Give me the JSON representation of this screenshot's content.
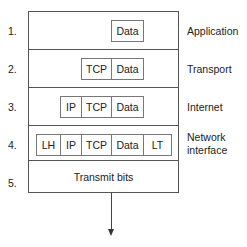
{
  "diagram": {
    "layers": [
      {
        "number": "1.",
        "name": "Application",
        "cells": [
          "Data"
        ]
      },
      {
        "number": "2.",
        "name": "Transport",
        "cells": [
          "TCP",
          "Data"
        ]
      },
      {
        "number": "3.",
        "name": "Internet",
        "cells": [
          "IP",
          "TCP",
          "Data"
        ]
      },
      {
        "number": "4.",
        "name_line1": "Network",
        "name_line2": "interface",
        "cells": [
          "LH",
          "IP",
          "TCP",
          "Data",
          "LT"
        ]
      },
      {
        "number": "5.",
        "text": "Transmit bits"
      }
    ],
    "arrow": "down-arrow"
  }
}
